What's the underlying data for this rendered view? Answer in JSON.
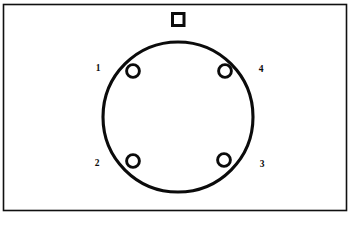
{
  "figure": {
    "kind": "connector-face-diagram",
    "background_color": "#ffffff",
    "line_color": "#0b0b0b",
    "frame": {
      "x": 3.5,
      "y": 4.5,
      "width": 343,
      "height": 206,
      "stroke_color": "#101010",
      "stroke_width": 1.6
    },
    "body": {
      "shape": "circle",
      "center_x": 178,
      "center_y": 117,
      "radius": 75,
      "stroke_width": 3.1,
      "fill": "#ffffff"
    },
    "keyway": {
      "shape": "rectangle",
      "x": 172.5,
      "y": 13.5,
      "width": 11.5,
      "height": 12,
      "stroke_width": 3.0,
      "fill": "#ffffff"
    },
    "pins": [
      {
        "number": "1",
        "hole_cx": 133,
        "hole_cy": 71,
        "hole_r": 6.4,
        "label_x": 98,
        "label_y": 68
      },
      {
        "number": "4",
        "hole_cx": 225,
        "hole_cy": 71,
        "hole_r": 6.4,
        "label_x": 261,
        "label_y": 69
      },
      {
        "number": "2",
        "hole_cx": 133,
        "hole_cy": 161,
        "hole_r": 6.4,
        "label_x": 97,
        "label_y": 163
      },
      {
        "number": "3",
        "hole_cx": 224,
        "hole_cy": 160,
        "hole_r": 6.4,
        "label_x": 262,
        "label_y": 164
      }
    ]
  }
}
